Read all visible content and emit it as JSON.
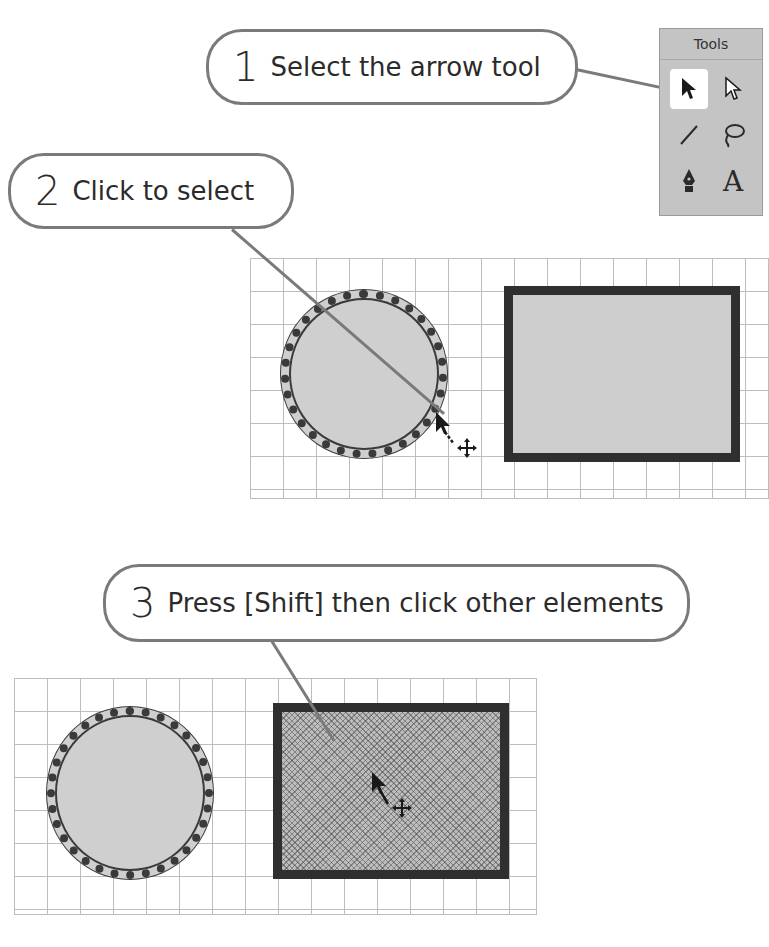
{
  "steps": [
    {
      "number": "1",
      "text": "Select the arrow tool"
    },
    {
      "number": "2",
      "text": "Click to select"
    },
    {
      "number": "3",
      "text": "Press [Shift] then click other elements"
    }
  ],
  "tools_panel": {
    "title": "Tools",
    "tools": [
      {
        "name": "arrow-tool",
        "icon": "arrow-icon",
        "active": true
      },
      {
        "name": "subselect-tool",
        "icon": "subselect-arrow-icon",
        "active": false
      },
      {
        "name": "line-tool",
        "icon": "line-icon",
        "active": false
      },
      {
        "name": "lasso-tool",
        "icon": "lasso-icon",
        "active": false
      },
      {
        "name": "pen-tool",
        "icon": "pen-icon",
        "active": false
      },
      {
        "name": "text-tool",
        "icon": "text-icon",
        "label": "A",
        "active": false
      }
    ]
  },
  "colors": {
    "callout_border": "#7a7a7a",
    "shape_fill": "#cdcdcd",
    "shape_stroke": "#2f2f2f",
    "grid_line": "#bdbdbd",
    "panel_bg": "#c4c4c4"
  }
}
